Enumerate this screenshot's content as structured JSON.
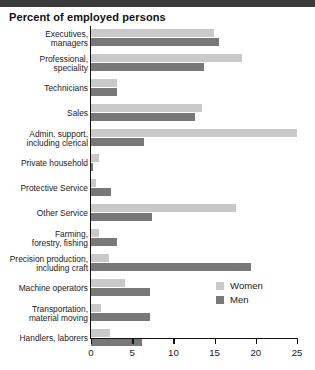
{
  "header": {
    "title": "Percent of employed persons"
  },
  "legend": {
    "position": "inside-right",
    "items": [
      {
        "label": "Women",
        "color": "#c9c9c9",
        "icon": "square-swatch-icon"
      },
      {
        "label": "Men",
        "color": "#787878",
        "icon": "square-swatch-icon"
      }
    ]
  },
  "axis": {
    "x_ticks": [
      "0",
      "5",
      "10",
      "15",
      "20",
      "25"
    ],
    "x_tick_values": [
      0,
      5,
      10,
      15,
      20,
      25
    ]
  },
  "chart_data": {
    "type": "bar",
    "orientation": "horizontal",
    "title": "Percent of employed persons",
    "xlabel": "",
    "ylabel": "",
    "xlim": [
      0,
      25
    ],
    "grid": false,
    "legend_position": "inside-right",
    "categories": [
      "Executives, managers",
      "Professional, speciality",
      "Technicians",
      "Sales",
      "Admin. support, including clerical",
      "Private household",
      "Protective Service",
      "Other Service",
      "Farming, forestry, fishing",
      "Precision production, including craft",
      "Machine operators",
      "Transportation, material moving",
      "Handlers, laborers"
    ],
    "category_lines": [
      [
        "Executives,",
        "managers"
      ],
      [
        "Professional,",
        "speciality"
      ],
      [
        "Technicians"
      ],
      [
        "Sales"
      ],
      [
        "Admin. support,",
        "including clerical"
      ],
      [
        "Private household"
      ],
      [
        "Protective Service"
      ],
      [
        "Other Service"
      ],
      [
        "Farming,",
        "forestry, fishing"
      ],
      [
        "Precision production,",
        "including craft"
      ],
      [
        "Machine operators"
      ],
      [
        "Transportation,",
        "material moving"
      ],
      [
        "Handlers, laborers"
      ]
    ],
    "series": [
      {
        "name": "Women",
        "color": "#c9c9c9",
        "values": [
          14.9,
          18.3,
          3.2,
          13.5,
          25.0,
          1.0,
          0.6,
          17.6,
          1.0,
          2.2,
          4.1,
          1.2,
          2.3
        ]
      },
      {
        "name": "Men",
        "color": "#787878",
        "values": [
          15.5,
          13.7,
          3.2,
          12.6,
          6.4,
          0.2,
          2.4,
          7.4,
          3.2,
          19.4,
          7.2,
          7.2,
          6.2
        ]
      }
    ]
  }
}
